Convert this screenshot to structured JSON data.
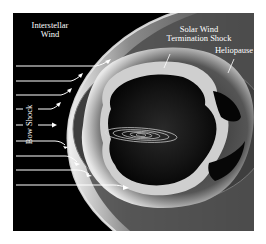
{
  "figure": {
    "type": "heliosphere-schematic",
    "labels": {
      "interstellar_wind_line1": "Interstellar",
      "interstellar_wind_line2": "Wind",
      "termination_shock_line1": "Solar Wind",
      "termination_shock_line2": "Termination Shock",
      "heliopause": "Heliopause",
      "bow_shock": "Bow Shock"
    },
    "colors": {
      "background": "#000000",
      "page": "#ffffff",
      "arrow": "#ffffff",
      "heliosheath": "#5a5a5a",
      "bow_shock_glow": "#d8d8d8"
    },
    "arrow_count": 9,
    "orbit_count": 5
  }
}
